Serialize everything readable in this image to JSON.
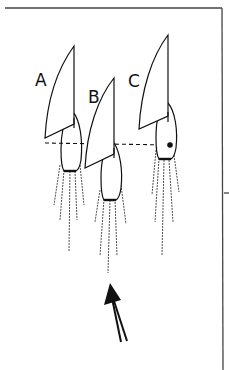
{
  "diagram": {
    "boats": [
      {
        "label": "A"
      },
      {
        "label": "B"
      },
      {
        "label": "C"
      }
    ],
    "colors": {
      "ink": "#111111",
      "frame": "#444444",
      "background": "#ffffff"
    }
  }
}
